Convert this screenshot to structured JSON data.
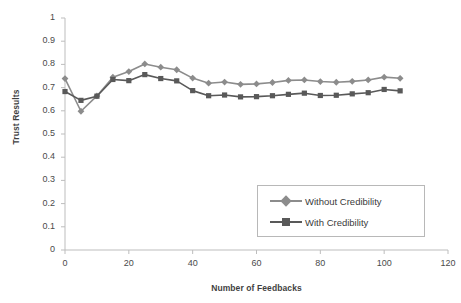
{
  "chart_data": {
    "type": "line",
    "title": "",
    "xlabel": "Number of Feedbacks",
    "ylabel": "Trust Results",
    "xlim": [
      0,
      120
    ],
    "ylim": [
      0,
      1
    ],
    "xticks": [
      "0",
      "20",
      "40",
      "60",
      "80",
      "100",
      "120"
    ],
    "yticks": [
      "0",
      "0.1",
      "0.2",
      "0.3",
      "0.4",
      "0.5",
      "0.6",
      "0.7",
      "0.8",
      "0.9",
      "1"
    ],
    "grid": false,
    "legend_position": "lower-right",
    "x": [
      0,
      5,
      10,
      15,
      20,
      25,
      30,
      35,
      40,
      45,
      50,
      55,
      60,
      65,
      70,
      75,
      80,
      85,
      90,
      95,
      100,
      105
    ],
    "series": [
      {
        "name": "Without Credibility",
        "color": "#8c8c8c",
        "marker": "diamond",
        "values": [
          0.739,
          0.598,
          0.664,
          0.745,
          0.769,
          0.802,
          0.788,
          0.777,
          0.741,
          0.719,
          0.724,
          0.714,
          0.716,
          0.722,
          0.731,
          0.733,
          0.726,
          0.723,
          0.727,
          0.733,
          0.745,
          0.74
        ]
      },
      {
        "name": "With Credibility",
        "color": "#595959",
        "marker": "square",
        "values": [
          0.683,
          0.645,
          0.663,
          0.735,
          0.73,
          0.756,
          0.739,
          0.729,
          0.687,
          0.665,
          0.668,
          0.66,
          0.661,
          0.665,
          0.671,
          0.676,
          0.666,
          0.667,
          0.673,
          0.678,
          0.692,
          0.686
        ]
      }
    ]
  },
  "legend": {
    "items": [
      {
        "label": "Without Credibility"
      },
      {
        "label": "With Credibility"
      }
    ]
  }
}
